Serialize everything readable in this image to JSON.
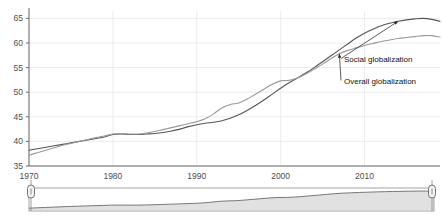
{
  "chart_data": {
    "type": "line",
    "title": "",
    "subtitle": "",
    "xlabel": "",
    "ylabel": "",
    "xlim": [
      1970,
      2019
    ],
    "ylim": [
      35,
      66.5
    ],
    "grid": true,
    "legend_position": "inline-annotations",
    "x_ticks": [
      "1970",
      "1980",
      "1990",
      "2000",
      "2010"
    ],
    "x_tick_values": [
      1970,
      1980,
      1990,
      2000,
      2010
    ],
    "y_ticks": [
      "35",
      "40",
      "45",
      "50",
      "55",
      "60",
      "65"
    ],
    "y_tick_values": [
      35,
      40,
      45,
      50,
      55,
      60,
      65
    ],
    "x": [
      1970,
      1971,
      1972,
      1973,
      1974,
      1975,
      1976,
      1977,
      1978,
      1979,
      1980,
      1981,
      1982,
      1983,
      1984,
      1985,
      1986,
      1987,
      1988,
      1989,
      1990,
      1991,
      1992,
      1993,
      1994,
      1995,
      1996,
      1997,
      1998,
      1999,
      2000,
      2001,
      2002,
      2003,
      2004,
      2005,
      2006,
      2007,
      2008,
      2009,
      2010,
      2011,
      2012,
      2013,
      2014,
      2015,
      2016,
      2017,
      2018,
      2019
    ],
    "series": [
      {
        "name": "Social globalization",
        "color": "#555555",
        "values": [
          38.2,
          38.5,
          38.8,
          39.1,
          39.4,
          39.7,
          40.0,
          40.3,
          40.6,
          40.9,
          41.4,
          41.5,
          41.4,
          41.4,
          41.5,
          41.6,
          41.8,
          42.1,
          42.5,
          43.0,
          43.4,
          43.7,
          43.9,
          44.2,
          44.7,
          45.4,
          46.3,
          47.3,
          48.4,
          49.6,
          50.8,
          51.9,
          52.9,
          53.9,
          55.0,
          56.2,
          57.4,
          58.6,
          59.8,
          61.0,
          62.0,
          62.8,
          63.5,
          64.0,
          64.4,
          64.7,
          64.9,
          65.0,
          64.8,
          64.4
        ]
      },
      {
        "name": "Overall globalization",
        "color": "#999999",
        "values": [
          37.2,
          37.7,
          38.2,
          38.7,
          39.2,
          39.6,
          40.0,
          40.4,
          40.8,
          41.1,
          41.5,
          41.6,
          41.5,
          41.5,
          41.7,
          42.0,
          42.4,
          42.8,
          43.2,
          43.6,
          44.0,
          44.6,
          45.6,
          46.8,
          47.5,
          47.8,
          48.6,
          49.6,
          50.6,
          51.6,
          52.3,
          52.4,
          52.9,
          53.7,
          54.7,
          55.7,
          56.8,
          57.8,
          58.5,
          59.0,
          59.5,
          59.9,
          60.3,
          60.6,
          60.9,
          61.1,
          61.3,
          61.5,
          61.5,
          61.2
        ]
      }
    ],
    "annotations": [
      {
        "name": "Social globalization",
        "label": "Social globalization",
        "target_x": 2014,
        "target_y": 64.4
      },
      {
        "name": "Overall globalization",
        "label": "Overall globalization",
        "target_x": 2007,
        "target_y": 57.8
      }
    ]
  },
  "navigator": {
    "name": "range-navigator",
    "left_handle_label": "",
    "right_handle_label": "",
    "series_color": "#c9c9c9",
    "series_line_color": "#6a6a6a"
  }
}
